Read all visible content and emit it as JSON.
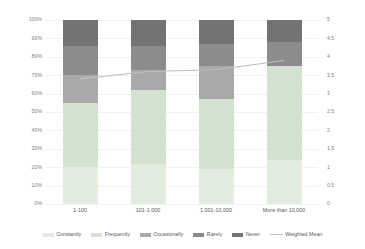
{
  "chart_data": {
    "type": "bar",
    "subtype": "stacked-bar-100pct-with-line-overlay",
    "title": "",
    "subtitle": "",
    "xlabel": "",
    "ylabel": "",
    "y2label": "",
    "categories": [
      "1-100",
      "101-1,000",
      "1,001-10,000",
      "More than 10,000"
    ],
    "series": [
      {
        "name": "Constantly",
        "color": "#e2eddf",
        "axis": "left",
        "values": [
          20,
          22,
          19,
          24
        ]
      },
      {
        "name": "Frequently",
        "color": "#d3e3d0",
        "axis": "left",
        "values": [
          35,
          40,
          38,
          51
        ]
      },
      {
        "name": "Occasionally",
        "color": "#a9a9a9",
        "axis": "left",
        "values": [
          15,
          11,
          18,
          0
        ]
      },
      {
        "name": "Rarely",
        "color": "#8c8c8c",
        "axis": "left",
        "values": [
          16,
          13,
          12,
          13
        ]
      },
      {
        "name": "Never",
        "color": "#737373",
        "axis": "left",
        "values": [
          14,
          14,
          13,
          12
        ]
      },
      {
        "name": "Weighted Mean",
        "color": "#bfbfbf",
        "axis": "right",
        "type": "line",
        "values": [
          3.4,
          3.6,
          3.65,
          3.9
        ]
      }
    ],
    "ylim": [
      0,
      100
    ],
    "yticks": [
      0,
      10,
      20,
      30,
      40,
      50,
      60,
      70,
      80,
      90,
      100
    ],
    "ytick_labels": [
      "0%",
      "10%",
      "20%",
      "30%",
      "40%",
      "50%",
      "60%",
      "70%",
      "80%",
      "90%",
      "100%"
    ],
    "y2lim": [
      0,
      5
    ],
    "y2ticks": [
      0,
      0.5,
      1,
      1.5,
      2,
      2.5,
      3,
      3.5,
      4,
      4.5,
      5
    ],
    "y2tick_labels": [
      "0",
      "0.5",
      "1",
      "1.5",
      "2",
      "2.5",
      "3",
      "3.5",
      "4",
      "4.5",
      "5"
    ],
    "grid": true,
    "legend_position": "bottom",
    "legend_entries": [
      "Constantly",
      "Frequently",
      "Occasionally",
      "Rarely",
      "Never",
      "Weighted Mean"
    ]
  },
  "colors": {
    "background": "#ffffff",
    "gridline": "#f1f1f1",
    "tick_text": "#7f7f7f",
    "label_text": "#595959",
    "line": "#bfbfbf"
  }
}
